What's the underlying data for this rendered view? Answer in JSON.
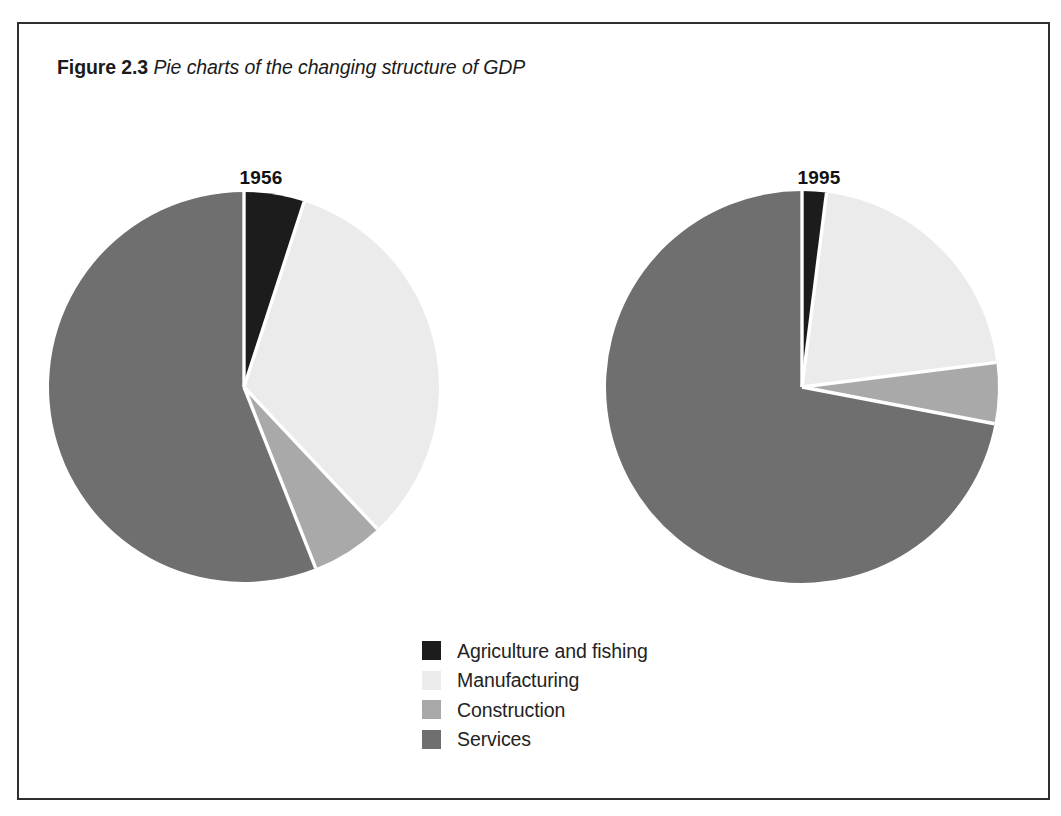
{
  "caption": {
    "label": "Figure 2.3",
    "text": "Pie charts of the changing structure of GDP"
  },
  "colors": {
    "agriculture": "#1c1c1c",
    "manufacturing": "#ebebeb",
    "construction": "#a9a9a9",
    "services": "#6f6f6f",
    "slice_divider": "#ffffff",
    "frame_border": "#2f2f33",
    "background": "#ffffff",
    "text": "#1b1b1b"
  },
  "legend": {
    "position": "bottom-center",
    "items": [
      {
        "label": "Agriculture and fishing",
        "color": "#1c1c1c"
      },
      {
        "label": "Manufacturing",
        "color": "#ebebeb"
      },
      {
        "label": "Construction",
        "color": "#a9a9a9"
      },
      {
        "label": "Services",
        "color": "#6f6f6f"
      }
    ]
  },
  "chart_data": [
    {
      "type": "pie",
      "title": "1956",
      "labels": [
        "Agriculture and fishing",
        "Manufacturing",
        "Construction",
        "Services"
      ],
      "values": [
        5,
        33,
        6,
        56
      ],
      "unit": "percent of GDP",
      "start_angle_deg": 0,
      "direction": "clockwise",
      "colors": [
        "#1c1c1c",
        "#ebebeb",
        "#a9a9a9",
        "#6f6f6f"
      ],
      "center": [
        242,
        380
      ],
      "radius": 195
    },
    {
      "type": "pie",
      "title": "1995",
      "labels": [
        "Agriculture and fishing",
        "Manufacturing",
        "Construction",
        "Services"
      ],
      "values": [
        2,
        21,
        5,
        72
      ],
      "unit": "percent of GDP",
      "start_angle_deg": 0,
      "direction": "clockwise",
      "colors": [
        "#1c1c1c",
        "#ebebeb",
        "#a9a9a9",
        "#6f6f6f"
      ],
      "center": [
        800,
        380
      ],
      "radius": 196
    }
  ]
}
